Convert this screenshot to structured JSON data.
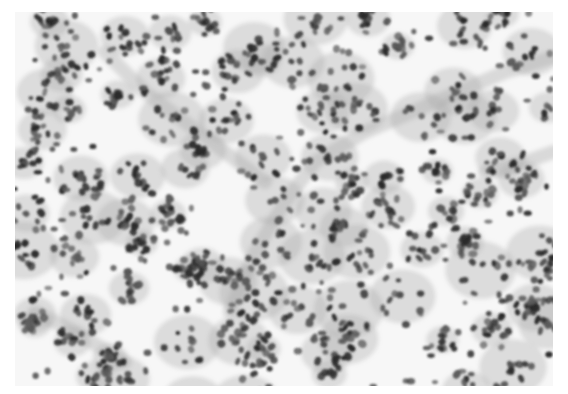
{
  "image": {
    "kind": "histology micrograph",
    "description": "Grayscale light micrograph of densely cellular tissue: clusters and rosette-like groups of dark-stained nuclei separated by pale spaces, crossed diagonally by a pale fibrous stromal band from lower-center to upper-right.",
    "color_mode": "grayscale",
    "palette": {
      "background": "#ffffff",
      "tissue_base": "#f7f7f7",
      "stroma": "#d9d9d9",
      "nucleus_dark": "#2b2b2b",
      "nucleus_mid": "#5a5a5a",
      "cytoplasm": "#a8a8a8"
    },
    "visible_text": []
  }
}
